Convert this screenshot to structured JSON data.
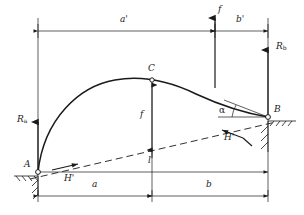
{
  "figure": {
    "type": "structural-diagram",
    "stroke_color": "#1a1a1a",
    "background_color": "#ffffff"
  },
  "points": {
    "a": {
      "label": "A",
      "x": 38,
      "y": 173,
      "role": "left-support-hinge"
    },
    "b": {
      "label": "B",
      "x": 268,
      "y": 117,
      "role": "right-support-hinge"
    },
    "c": {
      "label": "C",
      "x": 152,
      "y": 80,
      "role": "crown-hinge"
    }
  },
  "forces": {
    "ra": {
      "label": "R",
      "sub": "a",
      "direction": "up",
      "x": 38,
      "y": 173
    },
    "rb": {
      "label": "R",
      "sub": "b",
      "direction": "up",
      "x": 268,
      "y": 117
    },
    "load": {
      "label": "f",
      "direction": "down",
      "x": 215,
      "y": 30
    },
    "thrust_left": {
      "label": "H'",
      "direction": "up-right"
    },
    "thrust_right": {
      "label": "H'",
      "direction": "down-left"
    }
  },
  "angles": {
    "alpha": {
      "label": "α",
      "vertex": "B",
      "between": "horizontal and chord"
    }
  },
  "dimensions": {
    "top": [
      {
        "label": "a'",
        "from": "A",
        "to": "load line"
      },
      {
        "label": "b'",
        "from": "load line",
        "to": "B"
      }
    ],
    "bottom": [
      {
        "label": "a",
        "from": "A",
        "to": "C"
      },
      {
        "label": "b",
        "from": "C",
        "to": "B"
      }
    ],
    "vertical": [
      {
        "label": "f",
        "description": "rise from chord to crown C"
      }
    ],
    "chord": [
      {
        "label": "l",
        "description": "span along inclined chord A-B"
      }
    ]
  }
}
